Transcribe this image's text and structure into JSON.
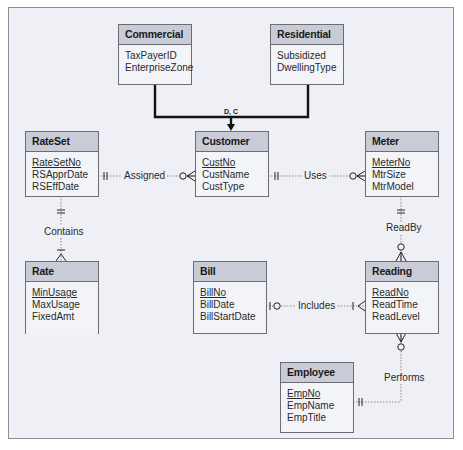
{
  "diagram": {
    "type": "ER diagram (crow's foot notation)",
    "entities": [
      {
        "name": "Commercial",
        "attributes": [
          {
            "name": "TaxPayerID",
            "pk": false
          },
          {
            "name": "EnterpriseZone",
            "pk": false
          }
        ]
      },
      {
        "name": "Residential",
        "attributes": [
          {
            "name": "Subsidized",
            "pk": false
          },
          {
            "name": "DwellingType",
            "pk": false
          }
        ]
      },
      {
        "name": "RateSet",
        "attributes": [
          {
            "name": "RateSetNo",
            "pk": true
          },
          {
            "name": "RSApprDate",
            "pk": false
          },
          {
            "name": "RSEffDate",
            "pk": false
          }
        ]
      },
      {
        "name": "Customer",
        "attributes": [
          {
            "name": "CustNo",
            "pk": true
          },
          {
            "name": "CustName",
            "pk": false
          },
          {
            "name": "CustType",
            "pk": false
          }
        ]
      },
      {
        "name": "Meter",
        "attributes": [
          {
            "name": "MeterNo",
            "pk": true
          },
          {
            "name": "MtrSize",
            "pk": false
          },
          {
            "name": "MtrModel",
            "pk": false
          }
        ]
      },
      {
        "name": "Rate",
        "weak": true,
        "attributes": [
          {
            "name": "MinUsage",
            "pk": true
          },
          {
            "name": "MaxUsage",
            "pk": false
          },
          {
            "name": "FixedAmt",
            "pk": false
          }
        ]
      },
      {
        "name": "Bill",
        "attributes": [
          {
            "name": "BillNo",
            "pk": true
          },
          {
            "name": "BillDate",
            "pk": false
          },
          {
            "name": "BillStartDate",
            "pk": false
          }
        ]
      },
      {
        "name": "Reading",
        "attributes": [
          {
            "name": "ReadNo",
            "pk": true
          },
          {
            "name": "ReadTime",
            "pk": false
          },
          {
            "name": "ReadLevel",
            "pk": false
          }
        ]
      },
      {
        "name": "Employee",
        "attributes": [
          {
            "name": "EmpNo",
            "pk": true
          },
          {
            "name": "EmpName",
            "pk": false
          },
          {
            "name": "EmpTitle",
            "pk": false
          }
        ]
      }
    ],
    "generalization": {
      "label": "D, C",
      "supertype": "Customer",
      "subtypes": [
        "Commercial",
        "Residential"
      ]
    },
    "relationships": [
      {
        "name": "Assigned",
        "from": "RateSet",
        "from_card": "exactly one",
        "to": "Customer",
        "to_card": "zero or many"
      },
      {
        "name": "Uses",
        "from": "Customer",
        "from_card": "exactly one",
        "to": "Meter",
        "to_card": "zero or many"
      },
      {
        "name": "Contains",
        "from": "RateSet",
        "from_card": "exactly one",
        "to": "Rate",
        "to_card": "one or many",
        "identifying": true
      },
      {
        "name": "ReadBy",
        "from": "Meter",
        "from_card": "exactly one",
        "to": "Reading",
        "to_card": "zero or many"
      },
      {
        "name": "Includes",
        "from": "Bill",
        "from_card": "zero or one",
        "to": "Reading",
        "to_card": "one or many"
      },
      {
        "name": "Performs",
        "from": "Employee",
        "from_card": "exactly one",
        "to": "Reading",
        "to_card": "zero or many"
      }
    ]
  },
  "labels": {
    "commercial": "Commercial",
    "residential": "Residential",
    "rateset": "RateSet",
    "customer": "Customer",
    "meter": "Meter",
    "rate": "Rate",
    "bill": "Bill",
    "reading": "Reading",
    "employee": "Employee",
    "gen": "D, C",
    "assigned": "Assigned",
    "uses": "Uses",
    "contains": "Contains",
    "readby": "ReadBy",
    "includes": "Includes",
    "performs": "Performs"
  },
  "attrs": {
    "commercial": [
      "TaxPayerID",
      "EnterpriseZone"
    ],
    "residential": [
      "Subsidized",
      "DwellingType"
    ],
    "rateset": [
      "RateSetNo",
      "RSApprDate",
      "RSEffDate"
    ],
    "customer": [
      "CustNo",
      "CustName",
      "CustType"
    ],
    "meter": [
      "MeterNo",
      "MtrSize",
      "MtrModel"
    ],
    "rate": [
      "MinUsage",
      "MaxUsage",
      "FixedAmt"
    ],
    "bill": [
      "BillNo",
      "BillDate",
      "BillStartDate"
    ],
    "reading": [
      "ReadNo",
      "ReadTime",
      "ReadLevel"
    ],
    "employee": [
      "EmpNo",
      "EmpName",
      "EmpTitle"
    ]
  },
  "colors": {
    "background": "#eef0f6",
    "entity_header": "#c9cbd6",
    "entity_body": "#f3f4f8",
    "line": "#1a1a1a"
  }
}
